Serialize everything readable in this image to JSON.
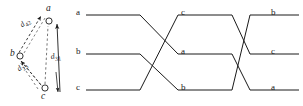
{
  "figure": {
    "background": "#ffffff",
    "ink": "#1a1a1a"
  },
  "left_diagram": {
    "name": "directed-graph",
    "nodes": [
      {
        "id": "a",
        "label": "a",
        "x": 49,
        "y": 21,
        "label_x": 46,
        "label_y": 7
      },
      {
        "id": "b",
        "label": "b",
        "x": 20,
        "y": 56,
        "label_x": 11,
        "label_y": 50
      },
      {
        "id": "c",
        "label": "c",
        "x": 45,
        "y": 88,
        "label_x": 41,
        "label_y": 93
      }
    ],
    "edges": [
      {
        "id": "d42",
        "label": "d",
        "sub": "42",
        "from": "b",
        "to": "a",
        "style": "dashed",
        "label_x": 20,
        "label_y": 26
      },
      {
        "id": "d23",
        "label": "d",
        "sub": "23",
        "from": "c",
        "to": "b",
        "style": "dashed",
        "label_x": 18,
        "label_y": 70
      },
      {
        "id": "d31",
        "label": "d",
        "sub": "31",
        "from": "c",
        "to": "a",
        "style": "solid",
        "label_x": 51,
        "label_y": 56
      }
    ]
  },
  "right_diagram": {
    "name": "braid-wiring-diagram",
    "tracks": [
      {
        "row": 0,
        "y": 15
      },
      {
        "row": 1,
        "y": 54
      },
      {
        "row": 2,
        "y": 90
      }
    ],
    "labels": [
      {
        "id": "left-top",
        "text": "a",
        "x": 76,
        "y": 9
      },
      {
        "id": "left-mid",
        "text": "b",
        "x": 76,
        "y": 48
      },
      {
        "id": "left-bot",
        "text": "c",
        "x": 76,
        "y": 84
      },
      {
        "id": "mid-top",
        "text": "c",
        "x": 181,
        "y": 9
      },
      {
        "id": "mid-mid",
        "text": "a",
        "x": 181,
        "y": 48
      },
      {
        "id": "mid-bot",
        "text": "b",
        "x": 181,
        "y": 84
      },
      {
        "id": "right-top",
        "text": "b",
        "x": 271,
        "y": 9
      },
      {
        "id": "right-mid",
        "text": "c",
        "x": 271,
        "y": 48
      },
      {
        "id": "right-bot",
        "text": "a",
        "x": 271,
        "y": 84
      }
    ]
  }
}
